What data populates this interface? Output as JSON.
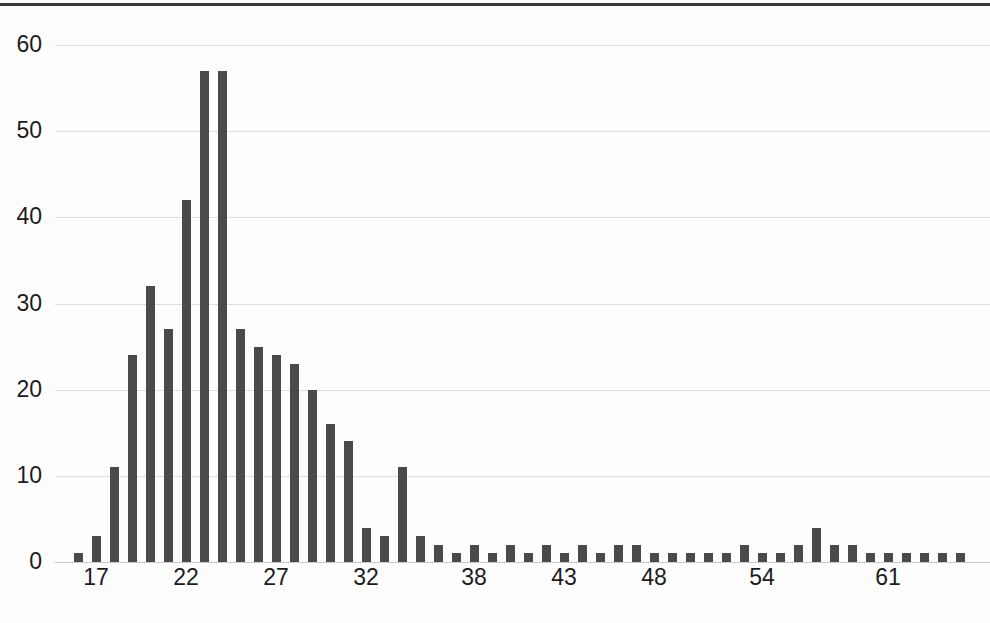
{
  "chart_data": {
    "type": "bar",
    "title": "",
    "subtitle": "",
    "xlabel": "",
    "ylabel": "",
    "xlim": [
      16,
      72
    ],
    "ylim": [
      0,
      60
    ],
    "grid": true,
    "legend": null,
    "bar_color": "#4a4a4a",
    "background_color": "#ffffff",
    "gridline_color": "#dedede",
    "y_ticks": [
      0,
      10,
      20,
      30,
      40,
      50,
      60
    ],
    "y_tick_labels": [
      "0",
      "10",
      "20",
      "30",
      "40",
      "50",
      "60"
    ],
    "x_tick_labels": [
      "17",
      "22",
      "27",
      "32",
      "38",
      "43",
      "48",
      "54",
      "61",
      "67"
    ],
    "x_tick_categories": [
      17,
      22,
      27,
      32,
      38,
      43,
      48,
      54,
      61,
      67
    ],
    "categories": [
      16,
      17,
      18,
      19,
      20,
      21,
      22,
      23,
      24,
      25,
      26,
      27,
      28,
      29,
      30,
      31,
      32,
      33,
      34,
      35,
      36,
      37,
      38,
      39,
      40,
      41,
      42,
      43,
      44,
      45,
      46,
      47,
      48,
      49,
      50,
      51,
      52,
      53,
      54,
      55,
      56,
      57,
      58,
      59,
      60,
      61,
      62,
      63,
      64,
      65
    ],
    "values": [
      1,
      3,
      11,
      24,
      32,
      27,
      42,
      57,
      57,
      27,
      25,
      24,
      23,
      20,
      16,
      14,
      4,
      3,
      11,
      3,
      2,
      1,
      2,
      1,
      2,
      1,
      2,
      1,
      2,
      1,
      2,
      2,
      1,
      1,
      1,
      1,
      1,
      2,
      1,
      1,
      2,
      4,
      2,
      2,
      1,
      1,
      1,
      1,
      1,
      1
    ]
  }
}
